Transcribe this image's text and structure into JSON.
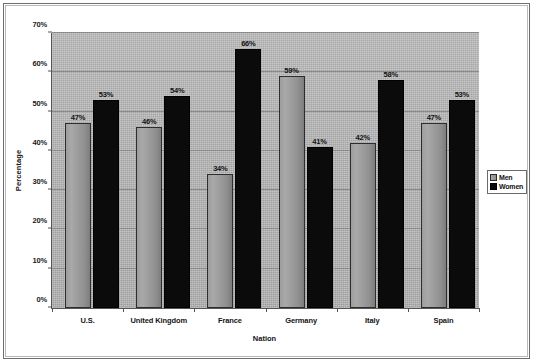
{
  "chart_data": {
    "type": "bar",
    "title": "",
    "xlabel": "Nation",
    "ylabel": "Percentage",
    "categories": [
      "U.S.",
      "United Kingdom",
      "France",
      "Germany",
      "Italy",
      "Spain"
    ],
    "series": [
      {
        "name": "Men",
        "color": "#9a9a9a",
        "values": [
          47,
          46,
          34,
          59,
          42,
          47
        ],
        "labels": [
          "47%",
          "46%",
          "34%",
          "59%",
          "42%",
          "47%"
        ]
      },
      {
        "name": "Women",
        "color": "#0b0b0b",
        "values": [
          53,
          54,
          66,
          41,
          58,
          53
        ],
        "labels": [
          "53%",
          "54%",
          "66%",
          "41%",
          "58%",
          "53%"
        ]
      }
    ],
    "ylim": [
      0,
      70
    ],
    "ytick_values": [
      0,
      10,
      20,
      30,
      40,
      50,
      60,
      70
    ],
    "ytick_labels": [
      "0%",
      "10%",
      "20%",
      "30%",
      "40%",
      "50%",
      "60%",
      "70%"
    ],
    "grid": true,
    "legend_position": "right",
    "legend_entries": [
      "Men",
      "Women"
    ],
    "plot_background": "#adadad",
    "frame_border": "#6e6e6e"
  }
}
